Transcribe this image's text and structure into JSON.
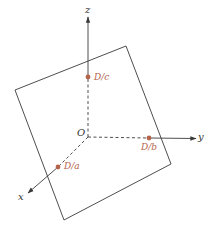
{
  "diagram": {
    "type": "3d-coordinate-plane-intercepts",
    "colors": {
      "line": "#3a3a3a",
      "accent": "#b5634b",
      "background": "#ffffff"
    },
    "origin": {
      "label": "O"
    },
    "axes": {
      "x": {
        "label": "x"
      },
      "y": {
        "label": "y"
      },
      "z": {
        "label": "z"
      }
    },
    "intercepts": [
      {
        "axis": "x",
        "label": "D/a"
      },
      {
        "axis": "y",
        "label": "D/b"
      },
      {
        "axis": "z",
        "label": "D/c"
      }
    ],
    "plane": {
      "shape": "square",
      "corners": [
        [
          15,
          90
        ],
        [
          126,
          46
        ],
        [
          171,
          164
        ],
        [
          64,
          220
        ]
      ]
    }
  }
}
